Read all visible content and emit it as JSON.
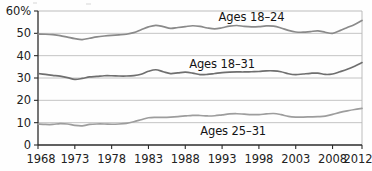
{
  "chart_data": {
    "type": "line",
    "title": "",
    "subtitle": "",
    "xlabel": "",
    "ylabel": "",
    "ylim": [
      0,
      60
    ],
    "xlim": [
      1968,
      2012
    ],
    "y_ticks": [
      0,
      10,
      20,
      30,
      40,
      50,
      60
    ],
    "y_tick_labels": [
      "0",
      "10",
      "20",
      "30",
      "40",
      "50",
      "60%"
    ],
    "x_ticks": [
      1968,
      1973,
      1978,
      1983,
      1988,
      1993,
      1998,
      2003,
      2008,
      2012
    ],
    "x_tick_labels": [
      "1968",
      "1973",
      "1978",
      "1983",
      "1988",
      "1993",
      "1998",
      "2003",
      "2008",
      "2012"
    ],
    "grid": true,
    "grid_axis": "y",
    "legend_position": "inline-annotation",
    "units": "percent",
    "series": [
      {
        "name": "Ages 18–24",
        "label": "Ages 18–24",
        "color": "#8a8a8a",
        "label_x": 1997.0,
        "label_y": 57.4,
        "x": [
          1968,
          1969,
          1970,
          1971,
          1972,
          1973,
          1974,
          1975,
          1976,
          1977,
          1978,
          1979,
          1980,
          1981,
          1982,
          1983,
          1984,
          1985,
          1986,
          1987,
          1988,
          1989,
          1990,
          1991,
          1992,
          1993,
          1994,
          1995,
          1996,
          1997,
          1998,
          1999,
          2000,
          2001,
          2002,
          2003,
          2004,
          2005,
          2006,
          2007,
          2008,
          2009,
          2010,
          2011,
          2012
        ],
        "values": [
          49.7,
          49.6,
          49.4,
          49.0,
          48.3,
          47.6,
          47.2,
          47.8,
          48.4,
          48.8,
          49.1,
          49.3,
          49.6,
          50.3,
          51.6,
          52.9,
          53.6,
          53.0,
          52.2,
          52.6,
          53.0,
          53.4,
          53.1,
          52.4,
          52.0,
          52.5,
          53.2,
          53.5,
          53.1,
          52.9,
          53.0,
          53.3,
          53.2,
          52.4,
          51.3,
          50.6,
          50.5,
          50.8,
          51.1,
          50.5,
          50.0,
          51.2,
          52.6,
          54.0,
          55.8
        ]
      },
      {
        "name": "Ages 18–31",
        "label": "Ages 18–31",
        "color": "#6f6f6f",
        "label_x": 1993.0,
        "label_y": 36.3,
        "x": [
          1968,
          1969,
          1970,
          1971,
          1972,
          1973,
          1974,
          1975,
          1976,
          1977,
          1978,
          1979,
          1980,
          1981,
          1982,
          1983,
          1984,
          1985,
          1986,
          1987,
          1988,
          1989,
          1990,
          1991,
          1992,
          1993,
          1994,
          1995,
          1996,
          1997,
          1998,
          1999,
          2000,
          2001,
          2002,
          2003,
          2004,
          2005,
          2006,
          2007,
          2008,
          2009,
          2010,
          2011,
          2012
        ],
        "values": [
          32.0,
          31.6,
          31.2,
          30.8,
          30.2,
          29.4,
          29.8,
          30.5,
          30.7,
          31.0,
          31.0,
          30.9,
          30.9,
          31.1,
          31.7,
          33.0,
          33.7,
          32.8,
          32.0,
          32.3,
          32.6,
          32.2,
          31.5,
          31.6,
          32.0,
          32.4,
          32.6,
          32.7,
          32.7,
          32.8,
          32.9,
          33.2,
          33.2,
          32.8,
          31.9,
          31.5,
          31.8,
          32.1,
          32.2,
          31.6,
          31.8,
          32.8,
          33.9,
          35.3,
          36.9
        ]
      },
      {
        "name": "Ages 25–31",
        "label": "Ages 25–31",
        "color": "#9d9d9d",
        "label_x": 1994.5,
        "label_y": 6.2,
        "x": [
          1968,
          1969,
          1970,
          1971,
          1972,
          1973,
          1974,
          1975,
          1976,
          1977,
          1978,
          1979,
          1980,
          1981,
          1982,
          1983,
          1984,
          1985,
          1986,
          1987,
          1988,
          1989,
          1990,
          1991,
          1992,
          1993,
          1994,
          1995,
          1996,
          1997,
          1998,
          1999,
          2000,
          2001,
          2002,
          2003,
          2004,
          2005,
          2006,
          2007,
          2008,
          2009,
          2010,
          2011,
          2012
        ],
        "values": [
          9.4,
          9.2,
          9.2,
          9.6,
          9.4,
          8.8,
          8.6,
          9.2,
          9.4,
          9.4,
          9.3,
          9.4,
          9.7,
          10.4,
          11.3,
          12.2,
          12.4,
          12.4,
          12.5,
          12.7,
          13.0,
          13.3,
          13.2,
          13.0,
          13.1,
          13.5,
          13.9,
          14.0,
          13.8,
          13.6,
          13.6,
          13.9,
          14.1,
          13.6,
          12.8,
          12.5,
          12.5,
          12.6,
          12.7,
          12.9,
          13.7,
          14.6,
          15.3,
          15.9,
          16.4
        ]
      }
    ]
  },
  "plot_geometry": {
    "left": 38,
    "right": 362,
    "top": 11,
    "bottom": 145
  },
  "style": {
    "axis_color": "#2b2b2b",
    "grid_color": "#b5b5b5",
    "background": "#fefefe"
  }
}
